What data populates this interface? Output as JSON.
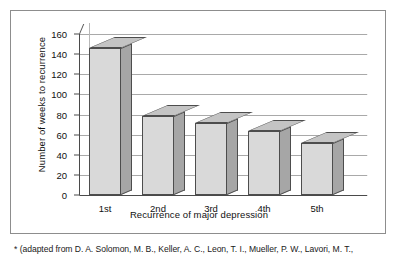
{
  "chart_data": {
    "type": "bar",
    "title": "",
    "categories": [
      "1st",
      "2nd",
      "3rd",
      "4th",
      "5th"
    ],
    "values": [
      146,
      79,
      72,
      64,
      52
    ],
    "xlabel": "Recurrence of major depression",
    "ylabel": "Number of weeks to recurrence",
    "ylim": [
      0,
      160
    ],
    "ytick_labels": [
      "0",
      "20",
      "40",
      "60",
      "80",
      "100",
      "120",
      "140",
      "160"
    ],
    "ytick_values": [
      0,
      20,
      40,
      60,
      80,
      100,
      120,
      140,
      160
    ],
    "grid": true,
    "legend": false,
    "style_3d": true,
    "colors": {
      "bar_face": "#d9d9d9",
      "bar_side": "#a6a6a6",
      "bar_top": "#c4c4c4",
      "bar_outline": "#4d4d4d",
      "gridline": "#a9a9a9",
      "axis": "#4a4a4a",
      "frame": "#8d8d8d",
      "text": "#111111",
      "background": "#ffffff"
    }
  },
  "footnote": {
    "text": "* (adapted from D. A. Solomon, M. B., Keller, A. C., Leon, T. I., Mueller, P. W., Lavori, M. T.,"
  }
}
